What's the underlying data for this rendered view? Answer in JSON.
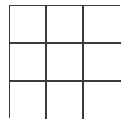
{
  "board": {
    "rows": 3,
    "cols": 3,
    "cells": [
      [
        "",
        "",
        ""
      ],
      [
        "",
        "",
        ""
      ],
      [
        "",
        "",
        ""
      ]
    ],
    "line_color": "#3a3a3a",
    "background": "#ffffff"
  }
}
